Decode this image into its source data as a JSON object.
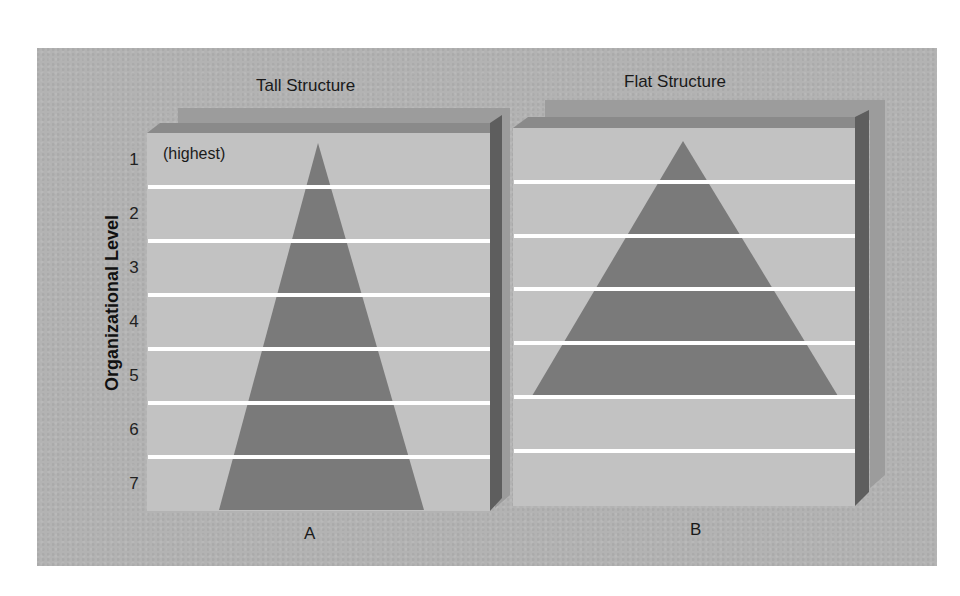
{
  "figure": {
    "y_axis_label": "Organizational Level",
    "levels": [
      "1",
      "2",
      "3",
      "4",
      "5",
      "6",
      "7"
    ],
    "top_level_note": "(highest)",
    "panels": [
      {
        "id": "A",
        "title": "Tall Structure",
        "letter": "A",
        "levels_occupied": 7
      },
      {
        "id": "B",
        "title": "Flat Structure",
        "letter": "B",
        "levels_occupied": 5
      }
    ]
  },
  "colors": {
    "background": "#b3b3b3",
    "panel_face": "#c2c2c2",
    "panel_edge_top": "#8a8a8a",
    "panel_edge_side": "#5e5e5e",
    "pyramid": "#7a7a7a",
    "level_lines": "#ffffff"
  }
}
